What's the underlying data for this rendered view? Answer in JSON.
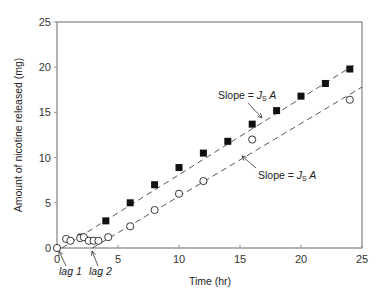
{
  "chart_data": {
    "type": "scatter",
    "title": "",
    "xlabel": "Time (hr)",
    "ylabel": "Amount of nicotine released (mg)",
    "xlim": [
      0,
      25
    ],
    "ylim": [
      0,
      25
    ],
    "xticks": [
      0,
      5,
      10,
      15,
      20,
      25
    ],
    "yticks": [
      0,
      5,
      10,
      15,
      20,
      25
    ],
    "grid": false,
    "legend": null,
    "series": [
      {
        "name": "filled squares",
        "marker": "filled-square",
        "x": [
          2,
          4,
          6,
          8,
          10,
          12,
          14,
          16,
          18,
          20,
          22,
          24
        ],
        "y": [
          1.2,
          3.0,
          5.0,
          7.0,
          8.9,
          10.5,
          11.8,
          13.7,
          15.2,
          16.8,
          18.2,
          19.8
        ],
        "fit_line": {
          "style": "dashed",
          "x": [
            0.4,
            24.3
          ],
          "y": [
            0.0,
            20.2
          ]
        }
      },
      {
        "name": "open circles",
        "marker": "open-circle",
        "x": [
          0,
          0.75,
          1.1,
          1.9,
          2.2,
          2.6,
          3.0,
          3.4,
          4.2,
          6,
          8,
          10,
          12,
          16,
          24
        ],
        "y": [
          0,
          1.0,
          0.8,
          1.1,
          1.2,
          0.8,
          0.8,
          0.8,
          1.2,
          2.4,
          4.2,
          6.0,
          7.4,
          12.0,
          16.4
        ],
        "fit_line": {
          "style": "dashed",
          "x": [
            2.9,
            25
          ],
          "y": [
            0.0,
            17.8
          ]
        }
      }
    ],
    "annotations": [
      {
        "text_prefix": "Slope = ",
        "symbol": "J",
        "subscript": "s",
        "suffix": " A",
        "points_to": "upper line",
        "x": 13.0,
        "y": 16.2
      },
      {
        "text_prefix": "Slope = ",
        "symbol": "J",
        "subscript": "s",
        "suffix": " A",
        "points_to": "lower line",
        "x": 17.0,
        "y": 9.0
      },
      {
        "text": "lag 1",
        "points_to_x": 0.3
      },
      {
        "text": "lag 2",
        "points_to_x": 2.9
      }
    ]
  },
  "labels": {
    "xlabel": "Time (hr)",
    "ylabel": "Amount of nicotine released (mg)",
    "lag1": "lag 1",
    "lag2": "lag 2",
    "slope_prefix": "Slope = ",
    "slope_J": "J",
    "slope_sub": "S",
    "slope_A": " A"
  }
}
